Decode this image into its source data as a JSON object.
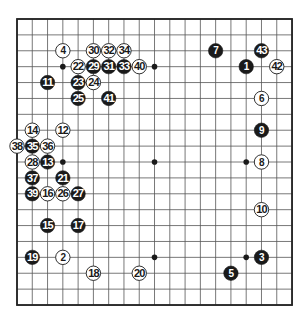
{
  "board": {
    "size": 19,
    "origin": {
      "x": 17,
      "y": 19
    },
    "spacing": {
      "x": 15.28,
      "y": 15.89
    },
    "colors": {
      "background": "#ffffff",
      "line": "#555555",
      "border": "#222222",
      "black_stone": "#1a1a1a",
      "white_stone": "#ffffff",
      "hoshi": "#1a1a1a"
    },
    "hoshi": [
      {
        "col": 3,
        "row": 3
      },
      {
        "col": 9,
        "row": 3
      },
      {
        "col": 15,
        "row": 3
      },
      {
        "col": 3,
        "row": 9
      },
      {
        "col": 9,
        "row": 9
      },
      {
        "col": 15,
        "row": 9
      },
      {
        "col": 3,
        "row": 15
      },
      {
        "col": 9,
        "row": 15
      },
      {
        "col": 15,
        "row": 15
      }
    ]
  },
  "stones": [
    {
      "n": "1",
      "color": "black",
      "col": 15,
      "row": 3
    },
    {
      "n": "2",
      "color": "white",
      "col": 3,
      "row": 15
    },
    {
      "n": "3",
      "color": "black",
      "col": 16,
      "row": 15
    },
    {
      "n": "4",
      "color": "white",
      "col": 3,
      "row": 2
    },
    {
      "n": "5",
      "color": "black",
      "col": 14,
      "row": 16
    },
    {
      "n": "6",
      "color": "white",
      "col": 16,
      "row": 5
    },
    {
      "n": "7",
      "color": "black",
      "col": 13,
      "row": 2
    },
    {
      "n": "8",
      "color": "white",
      "col": 16,
      "row": 9
    },
    {
      "n": "9",
      "color": "black",
      "col": 16,
      "row": 7
    },
    {
      "n": "10",
      "color": "white",
      "col": 16,
      "row": 12
    },
    {
      "n": "11",
      "color": "black",
      "col": 2,
      "row": 4
    },
    {
      "n": "12",
      "color": "white",
      "col": 3,
      "row": 7
    },
    {
      "n": "13",
      "color": "black",
      "col": 2,
      "row": 9
    },
    {
      "n": "14",
      "color": "white",
      "col": 1,
      "row": 7
    },
    {
      "n": "15",
      "color": "black",
      "col": 2,
      "row": 13
    },
    {
      "n": "16",
      "color": "white",
      "col": 2,
      "row": 11
    },
    {
      "n": "17",
      "color": "black",
      "col": 4,
      "row": 13
    },
    {
      "n": "18",
      "color": "white",
      "col": 5,
      "row": 16
    },
    {
      "n": "19",
      "color": "black",
      "col": 1,
      "row": 15
    },
    {
      "n": "20",
      "color": "white",
      "col": 8,
      "row": 16
    },
    {
      "n": "21",
      "color": "black",
      "col": 3,
      "row": 10
    },
    {
      "n": "22",
      "color": "white",
      "col": 4,
      "row": 3
    },
    {
      "n": "23",
      "color": "black",
      "col": 4,
      "row": 4
    },
    {
      "n": "24",
      "color": "white",
      "col": 5,
      "row": 4
    },
    {
      "n": "25",
      "color": "black",
      "col": 4,
      "row": 5
    },
    {
      "n": "26",
      "color": "white",
      "col": 3,
      "row": 11
    },
    {
      "n": "27",
      "color": "black",
      "col": 4,
      "row": 11
    },
    {
      "n": "28",
      "color": "white",
      "col": 1,
      "row": 9
    },
    {
      "n": "29",
      "color": "black",
      "col": 5,
      "row": 3
    },
    {
      "n": "30",
      "color": "white",
      "col": 5,
      "row": 2
    },
    {
      "n": "31",
      "color": "black",
      "col": 6,
      "row": 3
    },
    {
      "n": "32",
      "color": "white",
      "col": 6,
      "row": 2
    },
    {
      "n": "33",
      "color": "black",
      "col": 7,
      "row": 3
    },
    {
      "n": "34",
      "color": "white",
      "col": 7,
      "row": 2
    },
    {
      "n": "35",
      "color": "black",
      "col": 1,
      "row": 8
    },
    {
      "n": "36",
      "color": "white",
      "col": 2,
      "row": 8
    },
    {
      "n": "37",
      "color": "black",
      "col": 1,
      "row": 10
    },
    {
      "n": "38",
      "color": "white",
      "col": 0,
      "row": 8
    },
    {
      "n": "39",
      "color": "black",
      "col": 1,
      "row": 11
    },
    {
      "n": "40",
      "color": "white",
      "col": 8,
      "row": 3
    },
    {
      "n": "41",
      "color": "black",
      "col": 6,
      "row": 5
    },
    {
      "n": "42",
      "color": "white",
      "col": 17,
      "row": 3
    },
    {
      "n": "43",
      "color": "black",
      "col": 16,
      "row": 2
    }
  ]
}
